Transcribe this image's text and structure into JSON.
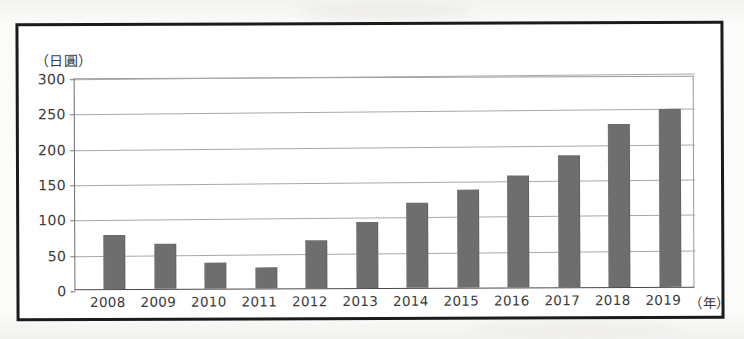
{
  "chart_data": {
    "type": "bar",
    "title": "",
    "subtitle": "",
    "xlabel": "（年）",
    "ylabel": "（日圓）",
    "categories": [
      "2008",
      "2009",
      "2010",
      "2011",
      "2012",
      "2013",
      "2014",
      "2015",
      "2016",
      "2017",
      "2018",
      "2019"
    ],
    "values": [
      77,
      63,
      37,
      30,
      68,
      94,
      120,
      139,
      158,
      187,
      231,
      252
    ],
    "series": [
      {
        "name": "",
        "values": [
          77,
          63,
          37,
          30,
          68,
          94,
          120,
          139,
          158,
          187,
          231,
          252
        ]
      }
    ],
    "ylim": [
      0,
      300
    ],
    "yticks": [
      0,
      50,
      100,
      150,
      200,
      250,
      300
    ],
    "ytick_labels": [
      "0",
      "50",
      "100",
      "150",
      "200",
      "250",
      "300"
    ],
    "grid": true,
    "legend": false,
    "legend_position": "none",
    "bar_color": "#6e6e6e",
    "gridline_color": "#a8a8a8",
    "axis_color": "#4a4a4a",
    "frame_color": "#1b1b1b",
    "background_color": "#ffffff"
  }
}
